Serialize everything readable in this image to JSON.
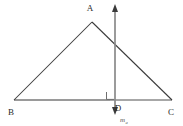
{
  "figure": {
    "background_color": "#ffffff",
    "width": 183,
    "height": 126,
    "colors": {
      "triangle_side": "#3a3a3a",
      "baseline": "#8a8a8a",
      "perpendicular_line": "#8a8a8a",
      "label": "#2b2b2b",
      "line_label": "#555555",
      "right_angle": "#6e6e6e"
    },
    "vertices": [
      {
        "name": "A",
        "label": "A",
        "x": 92,
        "y": 22,
        "label_x": 90,
        "label_y": 11
      },
      {
        "name": "B",
        "label": "B",
        "x": 14,
        "y": 100,
        "label_x": 10,
        "label_y": 114
      },
      {
        "name": "C",
        "label": "C",
        "x": 172,
        "y": 100,
        "label_x": 168,
        "label_y": 114
      },
      {
        "name": "D",
        "label": "D",
        "x": 115,
        "y": 100,
        "label_x": 117,
        "label_y": 111
      }
    ],
    "sides": [
      {
        "name": "side-BA",
        "from": "B",
        "to": "A",
        "x1": 14,
        "y1": 100,
        "x2": 92,
        "y2": 22
      },
      {
        "name": "side-AC",
        "from": "A",
        "to": "C",
        "x1": 92,
        "y1": 22,
        "x2": 172,
        "y2": 100
      },
      {
        "name": "side-BC",
        "from": "B",
        "to": "C",
        "x1": 14,
        "y1": 100,
        "x2": 172,
        "y2": 100
      }
    ],
    "perpendicular": {
      "name": "perpendicular-bisector",
      "label": "m",
      "label_subscript": "a",
      "x": 115,
      "y_top": 6,
      "y_bottom": 113,
      "label_x": 120,
      "label_y": 121,
      "arrow_top": true,
      "arrow_bottom": true
    },
    "right_angle": {
      "name": "right-angle-marker",
      "x": 106,
      "y": 91,
      "size": 8
    }
  }
}
